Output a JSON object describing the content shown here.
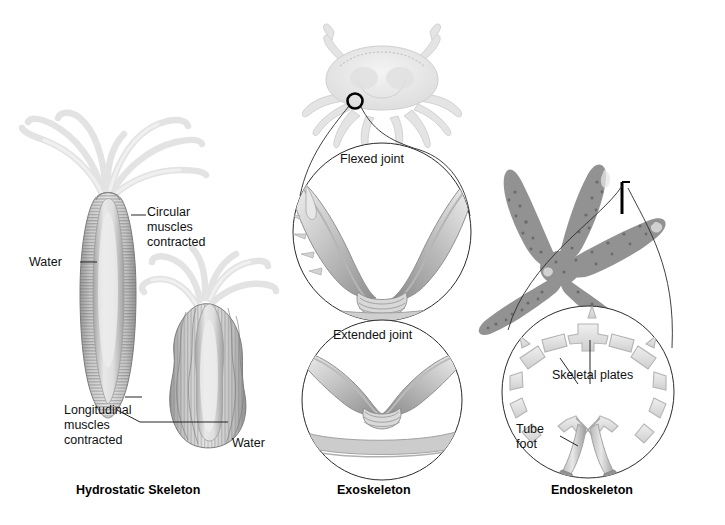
{
  "figure": {
    "type": "biology-diagram",
    "background": "#ffffff"
  },
  "panels": [
    {
      "id": "hydrostatic",
      "title": "Hydrostatic Skeleton",
      "organism": "hydra",
      "labels": [
        {
          "name": "circular-muscles",
          "text": "Circular\nmuscles\ncontracted"
        },
        {
          "name": "water-upper",
          "text": "Water"
        },
        {
          "name": "longitudinal-muscles",
          "text": "Longitudinal\nmuscles\ncontracted"
        },
        {
          "name": "water-lower",
          "text": "Water"
        }
      ]
    },
    {
      "id": "exoskeleton",
      "title": "Exoskeleton",
      "organism": "crab",
      "labels": [
        {
          "name": "flexed-joint",
          "text": "Flexed joint"
        },
        {
          "name": "extended-joint",
          "text": "Extended joint"
        }
      ]
    },
    {
      "id": "endoskeleton",
      "title": "Endoskeleton",
      "organism": "sea star",
      "labels": [
        {
          "name": "skeletal-plates",
          "text": "Skeletal plates"
        },
        {
          "name": "tube-foot",
          "text": "Tube\nfoot"
        }
      ]
    }
  ],
  "colors": {
    "line": "#1a1a1a",
    "text": "#111111",
    "tentacle": "#e4e4e4",
    "body_mid": "#a8a8a8",
    "body_light": "#d6d6d6",
    "plate": "#dcdcdc",
    "crab": "#e8e8e8",
    "star_dark": "#6f6f6f"
  }
}
